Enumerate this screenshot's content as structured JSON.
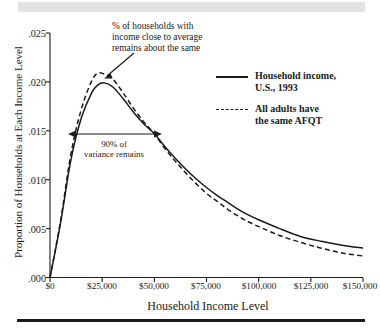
{
  "figure": {
    "y_axis_title": "Proportion of Households at Each Income Level",
    "x_axis_title": "Household Income Level",
    "y_ticks": [
      ".000",
      ".005",
      ".010",
      ".015",
      ".020",
      ".025"
    ],
    "x_ticks": [
      "$0",
      "$25,000",
      "$50,000",
      "$75,000",
      "$100,000",
      "$125,000",
      "$150,000"
    ]
  },
  "annotations": {
    "top": {
      "line1": "% of households with",
      "line2": "income close to average",
      "line3": "remains about the same"
    },
    "variance": {
      "line1": "90% of",
      "line2": "variance remains"
    }
  },
  "legend": {
    "items": [
      {
        "style": "solid",
        "line1": "Household income,",
        "line2": "U.S., 1993"
      },
      {
        "style": "dashed",
        "line1": "All adults have",
        "line2": "the same AFQT"
      }
    ]
  },
  "colors": {
    "ink": "#1a1a1a",
    "band": "#e3e3e3",
    "background": "#ffffff"
  },
  "chart_data": {
    "type": "line",
    "title": "",
    "xlabel": "Household Income Level",
    "ylabel": "Proportion of Households at Each Income Level",
    "xlim": [
      0,
      150000
    ],
    "ylim": [
      0.0,
      0.025
    ],
    "xtick_values": [
      0,
      25000,
      50000,
      75000,
      100000,
      125000,
      150000
    ],
    "ytick_values": [
      0.0,
      0.005,
      0.01,
      0.015,
      0.02,
      0.025
    ],
    "grid": false,
    "legend_position": "upper-right",
    "x": [
      0,
      5000,
      10000,
      15000,
      20000,
      23000,
      26000,
      30000,
      35000,
      40000,
      45000,
      50000,
      55000,
      60000,
      65000,
      70000,
      75000,
      80000,
      85000,
      90000,
      95000,
      100000,
      110000,
      120000,
      130000,
      140000,
      150000
    ],
    "series": [
      {
        "name": "Household income, U.S., 1993",
        "style": "solid",
        "values": [
          0.0,
          0.0055,
          0.012,
          0.0163,
          0.0189,
          0.0197,
          0.0199,
          0.0195,
          0.0183,
          0.0169,
          0.0157,
          0.0147,
          0.0134,
          0.0122,
          0.0111,
          0.0101,
          0.0092,
          0.0084,
          0.0077,
          0.007,
          0.0064,
          0.0059,
          0.005,
          0.0042,
          0.0037,
          0.0033,
          0.003
        ]
      },
      {
        "name": "All adults have the same AFQT",
        "style": "dashed",
        "values": [
          0.0,
          0.0057,
          0.0126,
          0.0172,
          0.0201,
          0.0209,
          0.0208,
          0.0203,
          0.0189,
          0.0173,
          0.0159,
          0.0147,
          0.0132,
          0.0119,
          0.0107,
          0.0096,
          0.0086,
          0.0078,
          0.007,
          0.0063,
          0.0057,
          0.0052,
          0.0043,
          0.0036,
          0.003,
          0.0025,
          0.0022
        ]
      }
    ],
    "annotations": [
      {
        "text": "% of households with income close to average remains about the same",
        "type": "arrow-callout",
        "points_to_x": 28000,
        "points_to_y": 0.0205
      },
      {
        "text": "90% of variance remains",
        "type": "double-arrow",
        "x_from": 9000,
        "x_to": 53000,
        "y": 0.0148
      }
    ]
  }
}
